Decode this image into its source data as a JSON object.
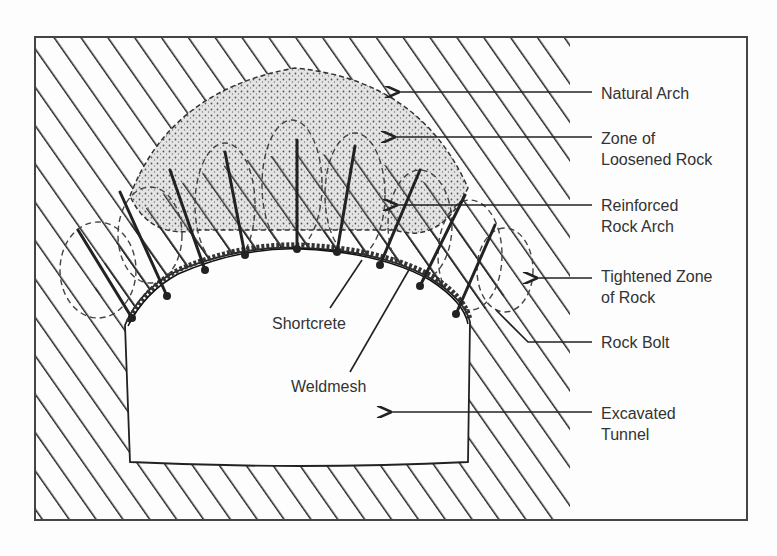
{
  "diagram": {
    "colors": {
      "ink": "#222222",
      "frame": "#444444",
      "label": "#333333",
      "background": "#fdfdfd"
    },
    "labels": {
      "natural_arch": "Natural Arch",
      "loosened_1": "Zone of",
      "loosened_2": "Loosened Rock",
      "reinforced_1": "Reinforced",
      "reinforced_2": "Rock Arch",
      "tightened_1": "Tightened Zone",
      "tightened_2": "of Rock",
      "rock_bolt": "Rock Bolt",
      "excavated_1": "Excavated",
      "excavated_2": "Tunnel",
      "shortcrete": "Shortcrete",
      "weldmesh": "Weldmesh"
    }
  }
}
